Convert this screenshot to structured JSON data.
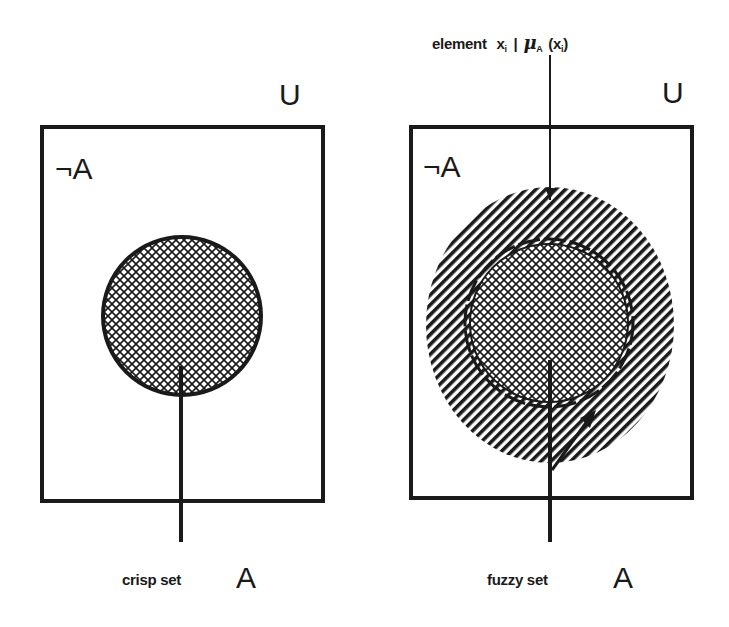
{
  "diagram": {
    "left_panel": {
      "universe_label": "U",
      "complement_label": "¬A",
      "caption_text": "crisp set",
      "caption_set": "A"
    },
    "right_panel": {
      "universe_label": "U",
      "complement_label": "¬A",
      "caption_text": "fuzzy set",
      "caption_set": "A",
      "annotation": {
        "prefix": "element",
        "x": "x",
        "x_sub": "i",
        "bar": "|",
        "mu": "μ",
        "mu_sub": "A",
        "arg_open": "(x",
        "arg_sub": "i",
        "arg_close": ")"
      }
    },
    "colors": {
      "ink": "#1a1a1a",
      "background": "#ffffff"
    }
  }
}
